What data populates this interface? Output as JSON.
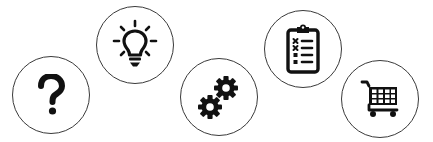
{
  "icons": [
    {
      "name": "question-icon",
      "label": "Help"
    },
    {
      "name": "lightbulb-icon",
      "label": "Ideas"
    },
    {
      "name": "gears-icon",
      "label": "Settings"
    },
    {
      "name": "clipboard-checklist-icon",
      "label": "Checklist"
    },
    {
      "name": "shopping-cart-icon",
      "label": "Shopping cart"
    }
  ],
  "colors": {
    "icon": "#111111",
    "circle_border": "#3a3a3a",
    "background": "#ffffff"
  }
}
